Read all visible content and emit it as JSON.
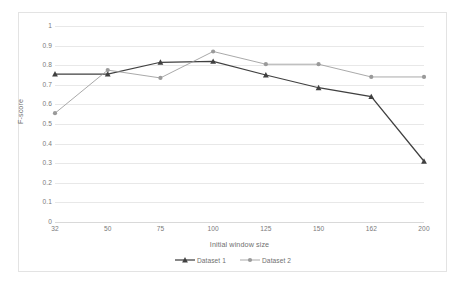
{
  "chart_data": {
    "type": "line",
    "title": "",
    "xlabel": "Initial window size",
    "ylabel": "F-score",
    "categories": [
      "32",
      "50",
      "75",
      "100",
      "125",
      "150",
      "162",
      "200"
    ],
    "ylim": [
      0,
      1
    ],
    "yticks": [
      "0",
      "0.1",
      "0.2",
      "0.3",
      "0.4",
      "0.5",
      "0.6",
      "0.7",
      "0.8",
      "0.9",
      "1"
    ],
    "ytick_values": [
      0,
      0.1,
      0.2,
      0.3,
      0.4,
      0.5,
      0.6,
      0.7,
      0.8,
      0.9,
      1
    ],
    "grid": "horizontal",
    "legend_position": "bottom-center",
    "series": [
      {
        "name": "Dataset 1",
        "color": "#404040",
        "marker": "triangle",
        "values": [
          0.755,
          0.755,
          0.815,
          0.82,
          0.75,
          0.685,
          0.64,
          0.31
        ]
      },
      {
        "name": "Dataset 2",
        "color": "#9a9a9a",
        "marker": "circle",
        "values": [
          0.555,
          0.775,
          0.735,
          0.87,
          0.805,
          0.805,
          0.74,
          0.74
        ]
      }
    ]
  },
  "legend": {
    "items": [
      {
        "label": "Dataset 1"
      },
      {
        "label": "Dataset 2"
      }
    ]
  },
  "axes": {
    "x_title": "Initial window size",
    "y_title": "F-score"
  },
  "colors": {
    "series1": "#404040",
    "series2": "#9a9a9a",
    "gridline": "#e8e8e8",
    "frame_border": "#e3e3e3",
    "tick_text": "#7a7a7a",
    "background": "#ffffff"
  }
}
